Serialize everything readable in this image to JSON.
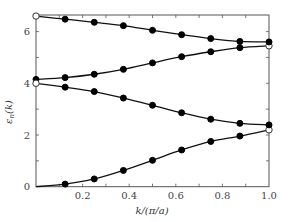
{
  "chart_data": {
    "type": "line",
    "title": "",
    "xlabel": "k/(π/a)",
    "ylabel": "ε_n(k)",
    "xlim": [
      0,
      1.0
    ],
    "ylim": [
      0,
      6.7
    ],
    "xticks": [
      0.2,
      0.4,
      0.6,
      0.8,
      1.0
    ],
    "xtick_labels": [
      "0.2",
      "0.4",
      "0.6",
      "0.8",
      "1.0"
    ],
    "yticks": [
      0,
      2,
      4,
      6
    ],
    "ytick_labels": [
      "0",
      "2",
      "4",
      "6"
    ],
    "grid": false,
    "legend": null,
    "x": [
      0,
      0.125,
      0.25,
      0.375,
      0.5,
      0.625,
      0.75,
      0.875,
      1.0
    ],
    "series": [
      {
        "name": "band 1",
        "values": [
          0.0,
          0.1,
          0.3,
          0.63,
          1.02,
          1.42,
          1.75,
          1.96,
          2.2
        ],
        "open_points": [
          8
        ]
      },
      {
        "name": "band 2",
        "values": [
          4.15,
          4.22,
          4.35,
          4.54,
          4.79,
          5.03,
          5.22,
          5.38,
          5.45
        ],
        "open_points": [
          8
        ]
      },
      {
        "name": "band 3",
        "values": [
          4.0,
          3.85,
          3.68,
          3.43,
          3.15,
          2.86,
          2.61,
          2.45,
          2.39
        ],
        "open_points": [
          0
        ]
      },
      {
        "name": "band 4",
        "values": [
          6.6,
          6.48,
          6.36,
          6.23,
          6.05,
          5.88,
          5.73,
          5.62,
          5.6
        ],
        "open_points": [
          0
        ]
      }
    ],
    "colors": {
      "line": "#111111",
      "marker": "#000000",
      "open_marker_fill": "#ffffff",
      "axis": "#555555"
    }
  }
}
